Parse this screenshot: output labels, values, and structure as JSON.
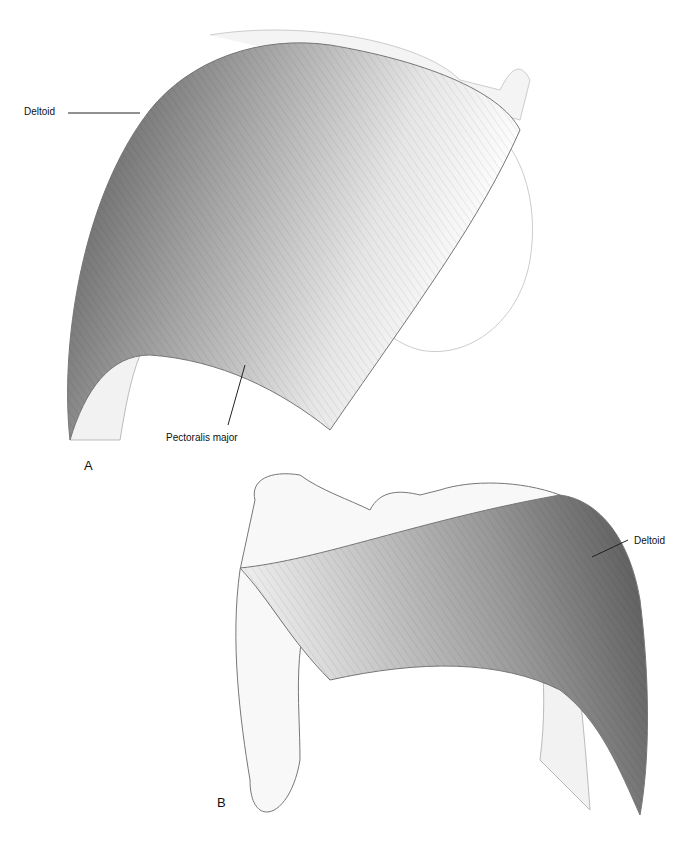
{
  "figure": {
    "panel_a": {
      "letter": "A",
      "labels": {
        "deltoid": "Deltoid",
        "pectoralis": "Pectoralis major"
      }
    },
    "panel_b": {
      "letter": "B",
      "labels": {
        "deltoid": "Deltoid"
      }
    }
  }
}
